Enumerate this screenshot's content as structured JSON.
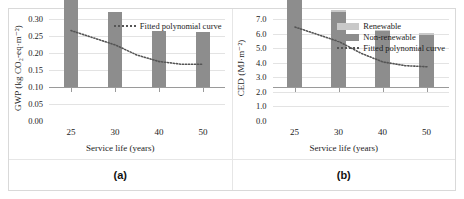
{
  "figure": {
    "captions": {
      "a": "(a)",
      "b": "(b)"
    }
  },
  "chart_data": [
    {
      "type": "bar",
      "panel": "(a)",
      "title": "",
      "xlabel": "Service life (years)",
      "ylabel": "GWP (kg CO₂-eq·m⁻²)",
      "categories": [
        "25",
        "30",
        "40",
        "50"
      ],
      "x": [
        25,
        30,
        40,
        50
      ],
      "values": [
        0.268,
        0.224,
        0.168,
        0.166
      ],
      "series": [
        {
          "name": "GWP",
          "values": [
            0.268,
            0.224,
            0.168,
            0.166
          ],
          "color": "#8d8d8d"
        }
      ],
      "fit": {
        "name": "Fitted polynomial curve",
        "style": "dotted",
        "color": "#555555",
        "points": [
          [
            25,
            0.266
          ],
          [
            30,
            0.224
          ],
          [
            35,
            0.194
          ],
          [
            40,
            0.175
          ],
          [
            45,
            0.167
          ],
          [
            50,
            0.167
          ]
        ]
      },
      "ylim": [
        0.0,
        0.3
      ],
      "yticks": [
        "0.00",
        "0.05",
        "0.10",
        "0.15",
        "0.20",
        "0.25",
        "0.30"
      ],
      "ytick_values": [
        0.0,
        0.05,
        0.1,
        0.15,
        0.2,
        0.25,
        0.3
      ],
      "grid": true,
      "legend_position": "top-right",
      "legend": [
        "Fitted polynomial curve"
      ]
    },
    {
      "type": "bar",
      "panel": "(b)",
      "title": "",
      "xlabel": "Service life (years)",
      "ylabel": "CED (MJ·m⁻²)",
      "categories": [
        "25",
        "30",
        "40",
        "50"
      ],
      "x": [
        25,
        30,
        40,
        50
      ],
      "stacked": true,
      "series": [
        {
          "name": "Non-renewable",
          "values": [
            6.3,
            5.2,
            3.9,
            3.65
          ],
          "color": "#8d8d8d"
        },
        {
          "name": "Renewable",
          "values": [
            0.2,
            0.15,
            0.1,
            0.1
          ],
          "color": "#c9c9c9"
        }
      ],
      "totals": [
        6.5,
        5.35,
        4.0,
        3.75
      ],
      "fit": {
        "name": "Fitted polynomial curve",
        "style": "dotted",
        "color": "#555555",
        "points": [
          [
            25,
            6.45
          ],
          [
            30,
            5.45
          ],
          [
            35,
            4.65
          ],
          [
            40,
            4.05
          ],
          [
            45,
            3.8
          ],
          [
            50,
            3.72
          ]
        ]
      },
      "ylim": [
        0.0,
        7.0
      ],
      "yticks": [
        "0.0",
        "1.0",
        "2.0",
        "3.0",
        "4.0",
        "5.0",
        "6.0",
        "7.0"
      ],
      "ytick_values": [
        0.0,
        1.0,
        2.0,
        3.0,
        4.0,
        5.0,
        6.0,
        7.0
      ],
      "grid": true,
      "legend_position": "top-right",
      "legend": [
        "Renewable",
        "Non-renewable",
        "Fitted polynomial curve"
      ]
    }
  ]
}
